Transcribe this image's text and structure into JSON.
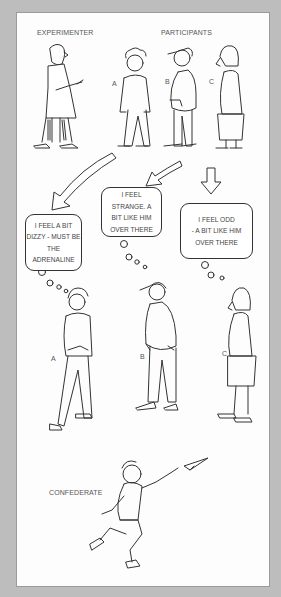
{
  "top_labels": {
    "experimenter": "EXPERIMENTER",
    "participants": "PARTICIPANTS"
  },
  "participants_top": [
    {
      "letter": "A"
    },
    {
      "letter": "B"
    },
    {
      "letter": "C"
    }
  ],
  "thoughts": [
    {
      "id": "A",
      "lines": [
        "I FEEL A BIT",
        "DIZZY - MUST BE",
        "THE",
        "ADRENALINE"
      ]
    },
    {
      "id": "B",
      "lines": [
        "I FEEL",
        "STRANGE. A",
        "BIT LIKE HIM",
        "OVER THERE"
      ]
    },
    {
      "id": "C",
      "lines": [
        "I FEEL ODD",
        "- A BIT LIKE HIM",
        "OVER THERE"
      ]
    }
  ],
  "participants_bottom": [
    {
      "letter": "A"
    },
    {
      "letter": "B"
    },
    {
      "letter": "C"
    }
  ],
  "confederate": {
    "label": "CONFEDERATE"
  },
  "colors": {
    "background": "#bdbdbd",
    "panel": "#fdfdfd",
    "ink": "#333333"
  }
}
